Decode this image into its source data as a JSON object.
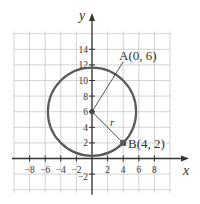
{
  "diagram": {
    "type": "coordinate-plane-circle",
    "axes": {
      "x_label": "x",
      "y_label": "y",
      "x_ticks": [
        {
          "value": -8,
          "label": "−8"
        },
        {
          "value": -6,
          "label": "−6"
        },
        {
          "value": -4,
          "label": "−4"
        },
        {
          "value": -2,
          "label": "−2"
        },
        {
          "value": 2,
          "label": "2"
        },
        {
          "value": 4,
          "label": "4"
        },
        {
          "value": 6,
          "label": "6"
        },
        {
          "value": 8,
          "label": "8"
        }
      ],
      "y_ticks": [
        {
          "value": -2,
          "label": "−2"
        },
        {
          "value": 2,
          "label": "2"
        },
        {
          "value": 4,
          "label": "4"
        },
        {
          "value": 6,
          "label": "6"
        },
        {
          "value": 8,
          "label": "8"
        },
        {
          "value": 10,
          "label": "10"
        },
        {
          "value": 12,
          "label": "12"
        },
        {
          "value": 14,
          "label": "14"
        }
      ]
    },
    "circle": {
      "center": [
        0,
        6
      ],
      "through": [
        4,
        2
      ],
      "radius_label": "r"
    },
    "points": [
      {
        "name": "A",
        "coords": [
          0,
          6
        ],
        "label": "A(0, 6)"
      },
      {
        "name": "B",
        "coords": [
          4,
          2
        ],
        "label": "B(4, 2)"
      }
    ],
    "colors": {
      "grid": "#c8c8c8",
      "axis": "#333333",
      "circle": "#5a5a5a",
      "point": "#4a4a4a"
    }
  }
}
